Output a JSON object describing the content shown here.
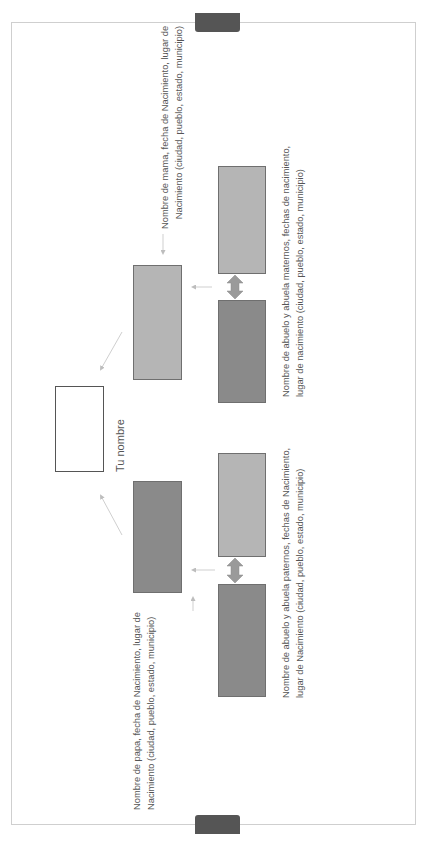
{
  "diagram": {
    "type": "family-tree",
    "orientation": "rotated-90-ccw",
    "colors": {
      "frame_border": "#cfcfcf",
      "tab": "#555555",
      "light_box": "#b5b5b5",
      "dark_box": "#8a8a8a",
      "arrow": "#c4c4c4",
      "double_arrow": "#9a9a9a",
      "text": "#555555"
    },
    "you": {
      "label": "Tu nombre"
    },
    "mother": {
      "label_line1": "Nombre de mama, fecha de Nacimiento, lugar de",
      "label_line2": "Nacimiento (ciudad, pueblo, estado, municipio)"
    },
    "father": {
      "label_line1": "Nombre de papa, fecha de Nacimiento, lugar de",
      "label_line2": "Nacimiento (ciudad, pueblo, estado, municipio)"
    },
    "maternal_grandparents": {
      "label_line1": "Nombre de abuelo y abuela maternos, fechas de nacimiento,",
      "label_line2": "lugar de nacimiento (ciudad, pueblo, estado, municipio)"
    },
    "paternal_grandparents": {
      "label_line1": "Nombre de abuelo y abuela paternos, fechas de Nacimiento,",
      "label_line2": "lugar de Nacimiento (ciudad, pueblo, estado, municipio)"
    }
  }
}
